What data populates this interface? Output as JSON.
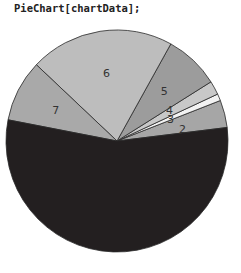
{
  "code_line": "PieChart[chartData];",
  "chart_data": {
    "type": "pie",
    "title": "",
    "categories": [
      "1",
      "2",
      "3",
      "4",
      "5",
      "6",
      "7"
    ],
    "values": [
      55,
      4,
      1,
      2,
      8,
      21,
      9
    ],
    "start_angle_deg": 7,
    "direction": "counterclockwise",
    "colors": [
      "#231f20",
      "#a6a6a6",
      "#f2f2f2",
      "#c8c8c8",
      "#9c9c9c",
      "#bdbdbd",
      "#a9a9a9"
    ],
    "labels_shown": [
      "2",
      "3",
      "4",
      "5",
      "6",
      "7"
    ],
    "legend": "none"
  }
}
